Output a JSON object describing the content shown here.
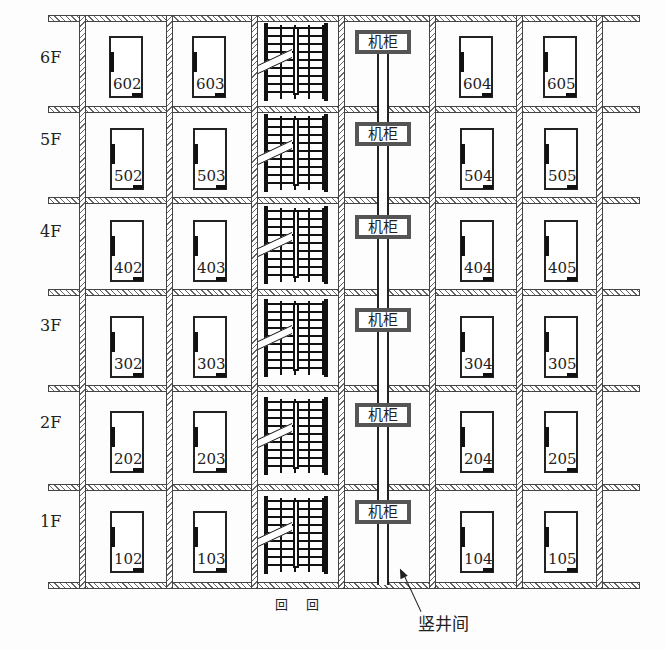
{
  "diagram": {
    "type": "building floor elevation / cable riser layout",
    "floors": [
      {
        "label": "6F",
        "rooms": [
          "602",
          "603",
          "604",
          "605"
        ],
        "cabinet": "机柜"
      },
      {
        "label": "5F",
        "rooms": [
          "502",
          "503",
          "504",
          "505"
        ],
        "cabinet": "机柜"
      },
      {
        "label": "4F",
        "rooms": [
          "402",
          "403",
          "404",
          "405"
        ],
        "cabinet": "机柜"
      },
      {
        "label": "3F",
        "rooms": [
          "302",
          "303",
          "304",
          "305"
        ],
        "cabinet": "机柜"
      },
      {
        "label": "2F",
        "rooms": [
          "202",
          "203",
          "204",
          "205"
        ],
        "cabinet": "机柜"
      },
      {
        "label": "1F",
        "rooms": [
          "102",
          "103",
          "104",
          "105"
        ],
        "cabinet": "机柜"
      }
    ],
    "shaft_label": "竖井间",
    "entrance_marks": [
      "回",
      "回"
    ],
    "colors": {
      "line": "#222222",
      "cabinet_border": "#555555",
      "background": "#fdfdfd"
    }
  }
}
